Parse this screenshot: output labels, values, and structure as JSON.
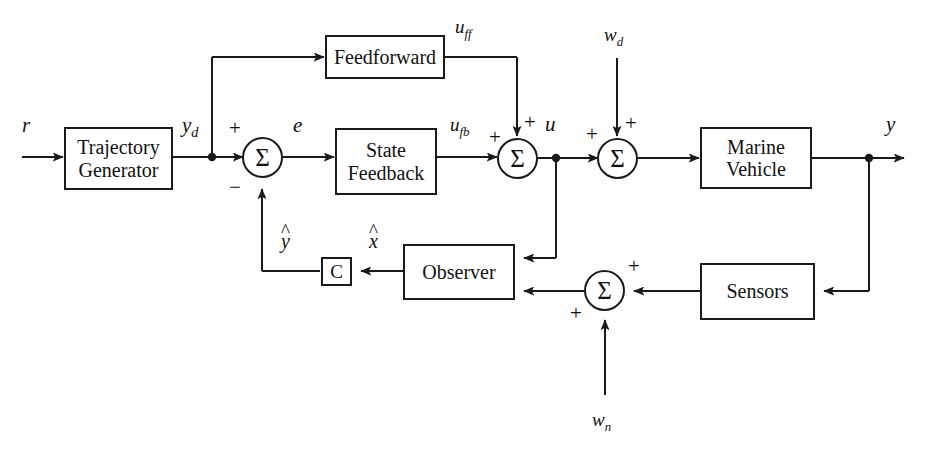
{
  "diagram": {
    "type": "control-system-block-diagram",
    "stroke_color": "#1a1a1a",
    "background_color": "#fdfdfb",
    "blocks": [
      {
        "id": "trajectory-generator",
        "line1": "Trajectory",
        "line2": "Generator"
      },
      {
        "id": "feedforward",
        "line1": "Feedforward",
        "line2": ""
      },
      {
        "id": "state-feedback",
        "line1": "State",
        "line2": "Feedback"
      },
      {
        "id": "marine-vehicle",
        "line1": "Marine",
        "line2": "Vehicle"
      },
      {
        "id": "observer",
        "line1": "Observer",
        "line2": ""
      },
      {
        "id": "sensors",
        "line1": "Sensors",
        "line2": ""
      },
      {
        "id": "output-matrix",
        "line1": "C",
        "line2": ""
      }
    ],
    "summing_junctions": [
      {
        "id": "error-sum",
        "glyph": "Σ",
        "signs": [
          "+",
          "−"
        ]
      },
      {
        "id": "control-sum",
        "glyph": "Σ",
        "signs": [
          "+",
          "+"
        ]
      },
      {
        "id": "disturbance-sum",
        "glyph": "Σ",
        "signs": [
          "+",
          "+"
        ]
      },
      {
        "id": "noise-sum",
        "glyph": "Σ",
        "signs": [
          "+",
          "+"
        ]
      }
    ],
    "signal_labels": {
      "reference": "r",
      "desired_output": "y",
      "desired_output_sub": "d",
      "error": "e",
      "feedforward_control": "u",
      "feedforward_control_sub": "ff",
      "feedback_control": "u",
      "feedback_control_sub": "fb",
      "total_control": "u",
      "disturbance": "w",
      "disturbance_sub": "d",
      "measurement_noise": "w",
      "measurement_noise_sub": "n",
      "output": "y",
      "state_estimate": "x",
      "output_estimate": "y"
    },
    "signs": {
      "plus": "+",
      "minus": "−"
    }
  }
}
